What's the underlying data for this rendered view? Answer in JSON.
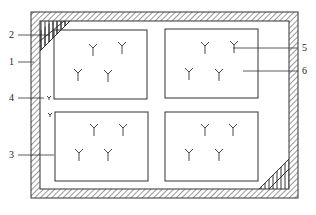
{
  "diagram": {
    "type": "plan-view schematic",
    "labels": [
      {
        "id": "1",
        "text": "1",
        "refers_to": "outer wall"
      },
      {
        "id": "2",
        "text": "2",
        "refers_to": "corner ramp (top-left)"
      },
      {
        "id": "3",
        "text": "3",
        "refers_to": "planting bed (bottom-left)"
      },
      {
        "id": "4",
        "text": "4",
        "refers_to": "single plant beside wall"
      },
      {
        "id": "5",
        "text": "5",
        "refers_to": "plant"
      },
      {
        "id": "6",
        "text": "6",
        "refers_to": "planting bed (top-right)"
      }
    ],
    "beds": [
      {
        "name": "top-left",
        "plants": 4
      },
      {
        "name": "top-right",
        "plants": 4
      },
      {
        "name": "bottom-left",
        "plants": 4
      },
      {
        "name": "bottom-right",
        "plants": 4
      }
    ],
    "corner_ramps": [
      "top-left",
      "bottom-right"
    ],
    "colors": {
      "line": "#333333",
      "background": "#ffffff"
    }
  }
}
